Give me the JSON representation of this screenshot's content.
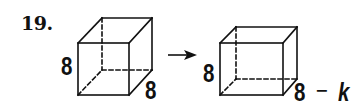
{
  "problem": {
    "number": "19."
  },
  "figure": {
    "original_cube": {
      "height_label": "8",
      "depth_label": "8"
    },
    "transform_arrow": "→",
    "new_cube": {
      "height_label": "8",
      "depth_label_base": "8",
      "depth_label_op": "−",
      "depth_label_var": "k"
    },
    "line_color": "#111111"
  }
}
